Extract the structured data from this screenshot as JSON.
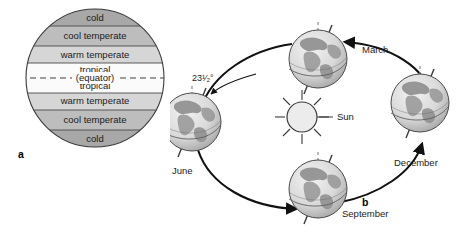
{
  "figure": {
    "panels": [
      {
        "letter": "a",
        "name": "climate-zones-diagram"
      },
      {
        "letter": "b",
        "name": "earth-orbit-seasons-diagram"
      }
    ]
  },
  "panel_a": {
    "letter": "a",
    "zones": [
      {
        "label": "cold",
        "shade": "#a8a8a8"
      },
      {
        "label": "cool temperate",
        "shade": "#bdbdbd"
      },
      {
        "label": "warm temperate",
        "shade": "#d6d6d6"
      },
      {
        "label": "tropical",
        "shade": "#fbfbfb"
      },
      {
        "label": "tropical",
        "shade": "#fbfbfb"
      },
      {
        "label": "warm temperate",
        "shade": "#d6d6d6"
      },
      {
        "label": "cool temperate",
        "shade": "#bdbdbd"
      },
      {
        "label": "cold",
        "shade": "#a8a8a8"
      }
    ],
    "equator_label": "(equator)",
    "outline_color": "#3a3a3a"
  },
  "panel_b": {
    "letter": "b",
    "sun_label": "Sun",
    "tilt_label": "23¹⁄₂°",
    "orbit_direction": "counterclockwise",
    "positions": [
      {
        "label": "March",
        "name": "globe-march"
      },
      {
        "label": "June",
        "name": "globe-june"
      },
      {
        "label": "September",
        "name": "globe-september"
      },
      {
        "label": "December",
        "name": "globe-december"
      }
    ],
    "colors": {
      "ocean": "#e8e8e8",
      "land": "#9a9a9a",
      "outline": "#4a4a4a",
      "orbit": "#111111",
      "axis": "#3a3a3a",
      "axis_dashed": "#8a8a8a"
    }
  }
}
